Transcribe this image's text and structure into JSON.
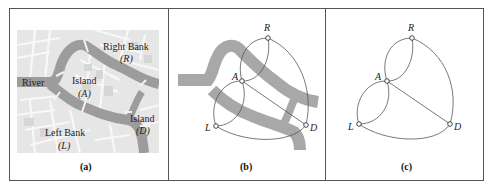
{
  "figure": {
    "panels": [
      {
        "id": "a",
        "caption": "(a)",
        "type": "map",
        "labels": {
          "river": "River",
          "island_a_name": "Island",
          "island_a_letter": "(A)",
          "right_bank_name": "Right Bank",
          "right_bank_letter": "(R)",
          "island_d_name": "Island",
          "island_d_letter": "(D)",
          "left_bank_name": "Left Bank",
          "left_bank_letter": "(L)"
        }
      },
      {
        "id": "b",
        "caption": "(b)",
        "type": "graph-over-river",
        "nodes": {
          "R": "R",
          "A": "A",
          "L": "L",
          "D": "D"
        }
      },
      {
        "id": "c",
        "caption": "(c)",
        "type": "graph",
        "nodes": {
          "R": "R",
          "A": "A",
          "L": "L",
          "D": "D"
        },
        "edges": [
          [
            "A",
            "R"
          ],
          [
            "A",
            "R"
          ],
          [
            "A",
            "L"
          ],
          [
            "A",
            "L"
          ],
          [
            "A",
            "D"
          ],
          [
            "R",
            "D"
          ],
          [
            "L",
            "D"
          ]
        ]
      }
    ],
    "colors": {
      "river": "#9a9a9a",
      "land": "#e6e6e6",
      "street": "#f7f7f7",
      "block": "#d4d4d4",
      "edge": "#555555",
      "frame": "#555555"
    }
  }
}
